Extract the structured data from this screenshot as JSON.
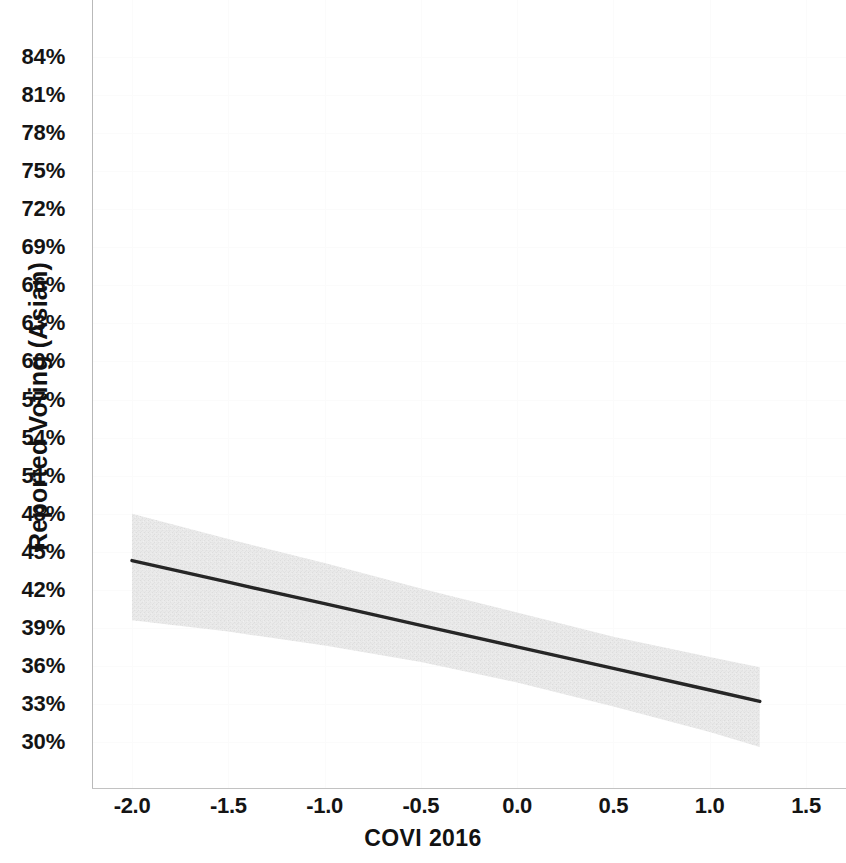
{
  "chart_data": {
    "type": "line",
    "title": "",
    "subtitle": "",
    "xlabel": "COVI 2016",
    "ylabel": "Reported Voting (Asian)",
    "grid": true,
    "legend": null,
    "xlim": [
      -2.2,
      1.62
    ],
    "ylim": [
      28.6,
      85.6
    ],
    "xticks": [
      "-2.0",
      "-1.5",
      "-1.0",
      "-0.5",
      "0.0",
      "0.5",
      "1.0",
      "1.5"
    ],
    "xtick_values": [
      -2.0,
      -1.5,
      -1.0,
      -0.5,
      0.0,
      0.5,
      1.0,
      1.5
    ],
    "yticks": [
      "84%",
      "81%",
      "78%",
      "75%",
      "72%",
      "69%",
      "66%",
      "63%",
      "60%",
      "57%",
      "54%",
      "51%",
      "48%",
      "45%",
      "42%",
      "39%",
      "36%",
      "33%",
      "30%"
    ],
    "ytick_values": [
      84,
      81,
      78,
      75,
      72,
      69,
      66,
      63,
      60,
      57,
      54,
      51,
      48,
      45,
      42,
      39,
      36,
      33,
      30
    ],
    "series": [
      {
        "name": "Predicted reported voting (Asian)",
        "type": "line",
        "color": "#262626",
        "x": [
          -2.0,
          -1.5,
          -1.0,
          -0.5,
          0.0,
          0.5,
          1.0,
          1.26
        ],
        "values": [
          44.3,
          42.6,
          40.9,
          39.2,
          37.5,
          35.8,
          34.1,
          33.2
        ]
      }
    ],
    "confidence_band": {
      "name": "95% confidence interval",
      "color": "#e8e8e8",
      "x": [
        -2.0,
        -1.5,
        -1.0,
        -0.5,
        0.0,
        0.5,
        1.0,
        1.26
      ],
      "upper": [
        48.0,
        46.0,
        44.1,
        42.1,
        40.2,
        38.3,
        36.7,
        35.9
      ],
      "lower": [
        39.6,
        38.7,
        37.6,
        36.3,
        34.7,
        32.8,
        30.8,
        29.6
      ]
    },
    "annotations": []
  },
  "axis": {
    "y_title": "Reported Voting (Asian)",
    "x_title": "COVI 2016"
  }
}
